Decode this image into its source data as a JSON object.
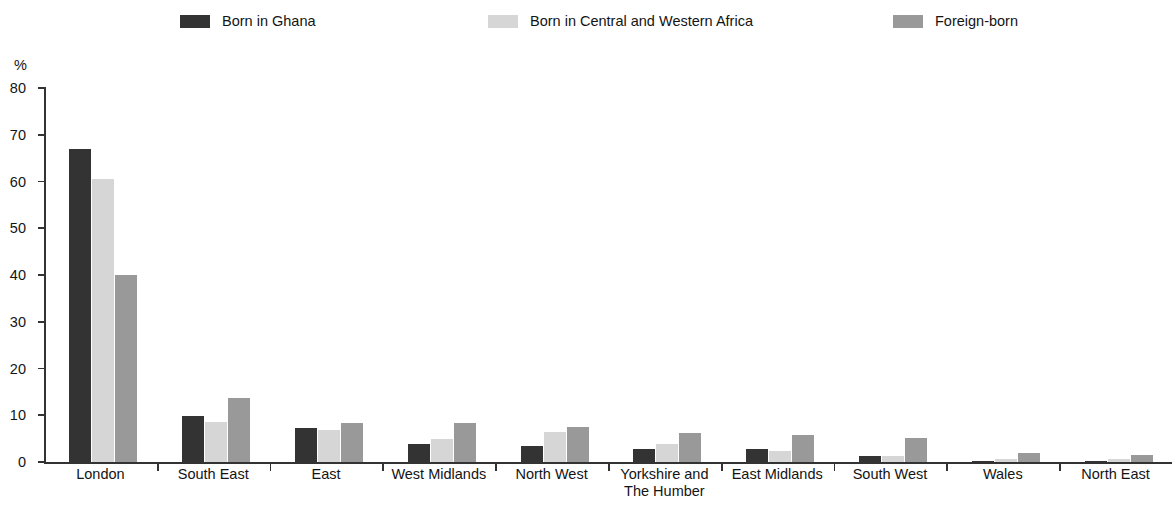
{
  "chart_data": {
    "type": "bar",
    "title": "",
    "subtitle": "",
    "xlabel": "",
    "ylabel": "%",
    "ylim": [
      0,
      80
    ],
    "yticks": [
      0,
      10,
      20,
      30,
      40,
      50,
      60,
      70,
      80
    ],
    "grid": false,
    "legend_position": "top",
    "categories": [
      "London",
      "South East",
      "East",
      "West Midlands",
      "North West",
      "Yorkshire and\nThe Humber",
      "East Midlands",
      "South West",
      "Wales",
      "North East"
    ],
    "series": [
      {
        "name": "Born in Ghana",
        "color": "#333333",
        "values": [
          67.0,
          9.8,
          7.2,
          3.8,
          3.4,
          2.8,
          2.7,
          1.3,
          0.3,
          0.2
        ]
      },
      {
        "name": "Born in Central and Western Africa",
        "color": "#d6d6d6",
        "values": [
          60.5,
          8.6,
          6.9,
          5.0,
          6.4,
          3.8,
          2.3,
          1.3,
          0.6,
          0.6
        ]
      },
      {
        "name": "Foreign-born",
        "color": "#999999",
        "values": [
          40.0,
          13.7,
          8.4,
          8.3,
          7.5,
          6.1,
          5.7,
          5.1,
          1.9,
          1.4
        ]
      }
    ]
  },
  "axis": {
    "y_unit": "%"
  }
}
